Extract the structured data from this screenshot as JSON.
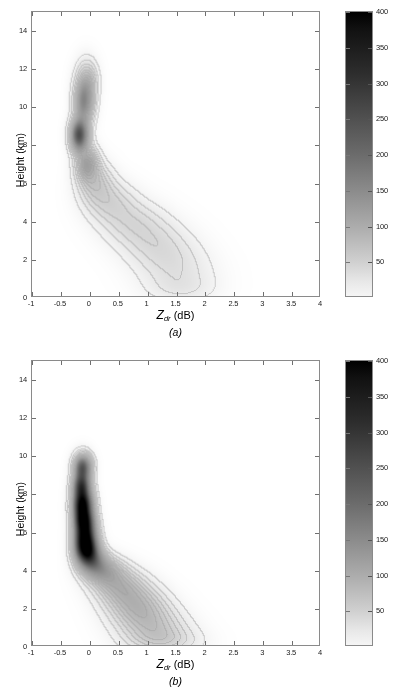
{
  "figure": {
    "type": "contour-density-pair",
    "panels": [
      {
        "id": "a",
        "caption": "(a)",
        "xlabel_var": "Z",
        "xlabel_sub": "dr",
        "xlabel_unit": "(dB)",
        "ylabel": "Height (km)"
      },
      {
        "id": "b",
        "caption": "(b)",
        "xlabel_var": "Z",
        "xlabel_sub": "dr",
        "xlabel_unit": "(dB)",
        "ylabel": "Height (km)"
      }
    ]
  },
  "chart_data": [
    {
      "type": "heatmap",
      "panel": "a",
      "title": "",
      "xlabel": "Zdr (dB)",
      "ylabel": "Height (km)",
      "xlim": [
        -1,
        4
      ],
      "ylim": [
        0,
        15
      ],
      "xticks": [
        -1,
        -0.5,
        0,
        0.5,
        1,
        1.5,
        2,
        2.5,
        3,
        3.5,
        4
      ],
      "xticklabels": [
        "-1",
        "-0.5",
        "0",
        "0.5",
        "1",
        "1.5",
        "2",
        "2.5",
        "3",
        "3.5",
        "4"
      ],
      "yticks": [
        0,
        2,
        4,
        6,
        8,
        10,
        12,
        14
      ],
      "yticklabels": [
        "0",
        "2",
        "4",
        "6",
        "8",
        "10",
        "12",
        "14"
      ],
      "grid": false,
      "colorbar": {
        "min": 0,
        "max": 400,
        "ticks": [
          50,
          100,
          150,
          200,
          250,
          300,
          350,
          400
        ],
        "ticklabels": [
          "50",
          "100",
          "150",
          "200",
          "250",
          "300",
          "350",
          "400"
        ],
        "colormap": "gray-inverted",
        "low_color": "#ffffff",
        "high_color": "#000000",
        "position": "right"
      },
      "description": "Faint contour density of Zdr versus height; weak concentration near Zdr = -0.2 dB between 7 and 11 km with a faint diagonal tail toward Zdr = 2 dB at low altitude.",
      "blobs": [
        {
          "x": -0.18,
          "y": 8.5,
          "sx": 0.1,
          "sy": 0.55,
          "peak": 250
        },
        {
          "x": -0.1,
          "y": 10.2,
          "sx": 0.11,
          "sy": 0.75,
          "peak": 150
        },
        {
          "x": -0.05,
          "y": 11.4,
          "sx": 0.12,
          "sy": 0.7,
          "peak": 70
        },
        {
          "x": -0.05,
          "y": 7.0,
          "sx": 0.13,
          "sy": 0.6,
          "peak": 110
        },
        {
          "x": 0.1,
          "y": 6.0,
          "sx": 0.2,
          "sy": 0.7,
          "peak": 55
        },
        {
          "x": 0.35,
          "y": 5.0,
          "sx": 0.28,
          "sy": 0.7,
          "peak": 40
        },
        {
          "x": 0.7,
          "y": 4.0,
          "sx": 0.35,
          "sy": 0.75,
          "peak": 32
        },
        {
          "x": 1.05,
          "y": 3.1,
          "sx": 0.38,
          "sy": 0.8,
          "peak": 28
        },
        {
          "x": 1.35,
          "y": 2.2,
          "sx": 0.4,
          "sy": 0.8,
          "peak": 24
        },
        {
          "x": 1.55,
          "y": 1.2,
          "sx": 0.42,
          "sy": 0.75,
          "peak": 20
        },
        {
          "x": 1.6,
          "y": 0.4,
          "sx": 0.4,
          "sy": 0.5,
          "peak": 16
        }
      ]
    },
    {
      "type": "heatmap",
      "panel": "b",
      "title": "",
      "xlabel": "Zdr (dB)",
      "ylabel": "Height (km)",
      "xlim": [
        -1,
        4
      ],
      "ylim": [
        0,
        15
      ],
      "xticks": [
        -1,
        -0.5,
        0,
        0.5,
        1,
        1.5,
        2,
        2.5,
        3,
        3.5,
        4
      ],
      "xticklabels": [
        "-1",
        "-0.5",
        "0",
        "0.5",
        "1",
        "1.5",
        "2",
        "2.5",
        "3",
        "3.5",
        "4"
      ],
      "yticks": [
        0,
        2,
        4,
        6,
        8,
        10,
        12,
        14
      ],
      "yticklabels": [
        "0",
        "2",
        "4",
        "6",
        "8",
        "10",
        "12",
        "14"
      ],
      "grid": false,
      "colorbar": {
        "min": 0,
        "max": 400,
        "ticks": [
          50,
          100,
          150,
          200,
          250,
          300,
          350,
          400
        ],
        "ticklabels": [
          "50",
          "100",
          "150",
          "200",
          "250",
          "300",
          "350",
          "400"
        ],
        "colormap": "gray-inverted",
        "low_color": "#ffffff",
        "high_color": "#000000",
        "position": "right"
      },
      "description": "Strong dark vertical band near Zdr = -0.1 dB spanning 5 to 10 km with peak counts above 350, plus a pronounced diagonal tail reaching Zdr = 1.8 dB near the surface.",
      "blobs": [
        {
          "x": -0.12,
          "y": 9.4,
          "sx": 0.1,
          "sy": 0.45,
          "peak": 230
        },
        {
          "x": -0.14,
          "y": 8.4,
          "sx": 0.1,
          "sy": 0.45,
          "peak": 260
        },
        {
          "x": -0.12,
          "y": 7.4,
          "sx": 0.11,
          "sy": 0.5,
          "peak": 390
        },
        {
          "x": -0.1,
          "y": 6.6,
          "sx": 0.11,
          "sy": 0.4,
          "peak": 250
        },
        {
          "x": -0.08,
          "y": 5.8,
          "sx": 0.12,
          "sy": 0.55,
          "peak": 380
        },
        {
          "x": -0.05,
          "y": 5.0,
          "sx": 0.13,
          "sy": 0.45,
          "peak": 300
        },
        {
          "x": 0.05,
          "y": 4.4,
          "sx": 0.16,
          "sy": 0.45,
          "peak": 140
        },
        {
          "x": 0.25,
          "y": 3.9,
          "sx": 0.22,
          "sy": 0.5,
          "peak": 90
        },
        {
          "x": 0.5,
          "y": 3.2,
          "sx": 0.28,
          "sy": 0.6,
          "peak": 70
        },
        {
          "x": 0.75,
          "y": 2.4,
          "sx": 0.32,
          "sy": 0.65,
          "peak": 62
        },
        {
          "x": 0.95,
          "y": 1.6,
          "sx": 0.35,
          "sy": 0.65,
          "peak": 55
        },
        {
          "x": 1.15,
          "y": 0.8,
          "sx": 0.38,
          "sy": 0.6,
          "peak": 45
        },
        {
          "x": 1.3,
          "y": 0.2,
          "sx": 0.4,
          "sy": 0.45,
          "peak": 35
        }
      ]
    }
  ]
}
